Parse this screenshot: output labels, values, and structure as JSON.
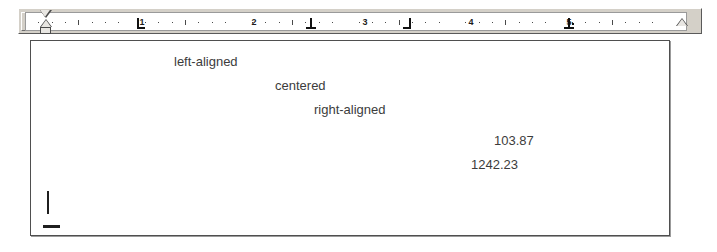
{
  "window": {
    "title": "Tab alignment demo"
  },
  "ruler": {
    "unit": "inch",
    "tab_selector": {
      "icon": "left-tab-icon",
      "label": "L",
      "selected_tab_type": "left"
    },
    "numbers": [
      "1",
      "2",
      "3",
      "4",
      "5"
    ],
    "number_positions_px": [
      141,
      253,
      364,
      470,
      568
    ],
    "tab_stops": [
      {
        "type": "left",
        "label": "L",
        "position_px": 141,
        "position_in": "1.0"
      },
      {
        "type": "center",
        "label": "⊥",
        "position_px": 310,
        "position_in": "2.5"
      },
      {
        "type": "right",
        "label": "┐",
        "position_px": 407,
        "position_in": "3.4"
      },
      {
        "type": "decimal",
        "label": "⊥.",
        "position_px": 568,
        "position_in": "5.0"
      }
    ],
    "indent_markers": {
      "first_line_indent_px": 24,
      "hanging_indent_px": 24,
      "left_indent_px": 24,
      "right_indent_px": 681
    }
  },
  "document": {
    "lines": [
      {
        "text": "left-aligned",
        "align": "left",
        "left_px": 143,
        "top_px": 13
      },
      {
        "text": "centered",
        "align": "center",
        "left_px": 244,
        "top_px": 37
      },
      {
        "text": "right-aligned",
        "align": "right",
        "left_px": 283,
        "top_px": 61
      },
      {
        "text": "103.87",
        "align": "decimal",
        "left_px": 463,
        "top_px": 92
      },
      {
        "text": "1242.23",
        "align": "decimal",
        "left_px": 440,
        "top_px": 116
      }
    ],
    "caret": {
      "visible": true
    },
    "end_mark": {
      "visible": true
    }
  }
}
